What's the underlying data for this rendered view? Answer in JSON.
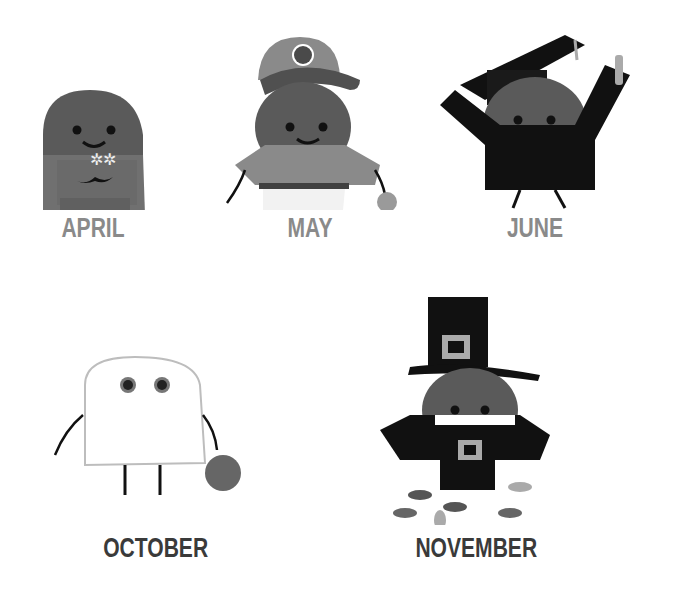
{
  "illustration": {
    "characters": [
      {
        "month": "APRIL",
        "costume": "jacket-with-flowers",
        "label_color": "#8a8a8a"
      },
      {
        "month": "MAY",
        "costume": "baseball-player",
        "label_color": "#8a8a8a"
      },
      {
        "month": "JUNE",
        "costume": "graduate",
        "label_color": "#8a8a8a"
      },
      {
        "month": "OCTOBER",
        "costume": "ghost-with-pumpkin",
        "label_color": "#3a3a3a"
      },
      {
        "month": "NOVEMBER",
        "costume": "pilgrim-with-leaves",
        "label_color": "#3a3a3a"
      }
    ]
  }
}
